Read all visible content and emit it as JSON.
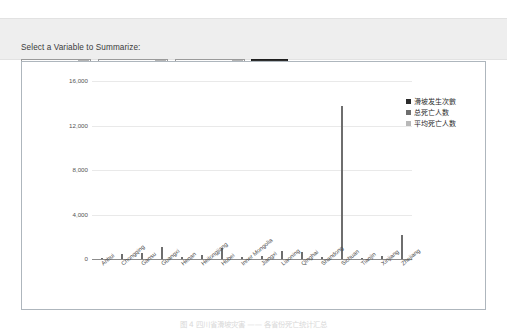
{
  "form": {
    "label": "Select a Variable to Summarize:",
    "province_select": {
      "value": "Province",
      "icon": "chevron-down-icon"
    },
    "charttype_select": {
      "value": "Column Chart",
      "icon": "chevron-down-icon"
    },
    "measure_select": {
      "value": "Fatalities",
      "icon": "chevron-down-icon"
    },
    "submit_label": "Submit"
  },
  "caption": {
    "text": "图 4    四川省滑坡灾害 —— 各省份死亡统计汇总"
  },
  "colors": {
    "bar": "#6e6e6e",
    "legend_series_1": "#2b2b2b",
    "legend_series_2": "#6e6e6e",
    "legend_series_3": "#b8b8b8",
    "panel_border": "#aeb6bd",
    "header_bg": "#eeeeee",
    "submit_bg": "#2f2f2f"
  },
  "chart_data": {
    "type": "bar",
    "title": "",
    "xlabel": "",
    "ylabel": "",
    "ylim": [
      0,
      18000
    ],
    "yticks": [
      0,
      4000,
      8000,
      12000,
      16000
    ],
    "ytick_labels": [
      "0",
      "4,000",
      "8,000",
      "12,000",
      "16,000"
    ],
    "grid": true,
    "legend_position": "right",
    "legend": [
      "滑坡发生次數",
      "总死亡人数",
      "平均死亡人数"
    ],
    "categories": [
      "Anhui",
      "Chongqing",
      "Gansu",
      "Guangxi",
      "Henan",
      "Heilongjiang",
      "Hubei",
      "Inner Mongolia",
      "Jiangxi",
      "Liaoning",
      "Qinghai",
      "Shandong",
      "Sichuan",
      "Tianjin",
      "Xinjiang",
      "Zhejiang"
    ],
    "values": [
      60,
      420,
      540,
      1050,
      210,
      330,
      980,
      150,
      260,
      700,
      640,
      180,
      13800,
      120,
      290,
      2200
    ]
  }
}
